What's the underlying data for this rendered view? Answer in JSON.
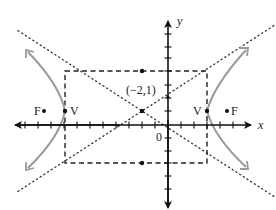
{
  "diagram": {
    "type": "hyperbola",
    "axes": {
      "x_label": "x",
      "y_label": "y",
      "origin_label": "0"
    },
    "center": {
      "label": "(−2,1)",
      "x": -2,
      "y": 1
    },
    "vertices": [
      {
        "label": "V",
        "side": "left"
      },
      {
        "label": "V",
        "side": "right"
      }
    ],
    "foci": [
      {
        "label": "F",
        "side": "left"
      },
      {
        "label": "F",
        "side": "right"
      }
    ],
    "colors": {
      "axis": "#111111",
      "curve": "#9a9a9a",
      "box": "#222222",
      "asymptote": "#333333",
      "text": "#222222"
    }
  }
}
